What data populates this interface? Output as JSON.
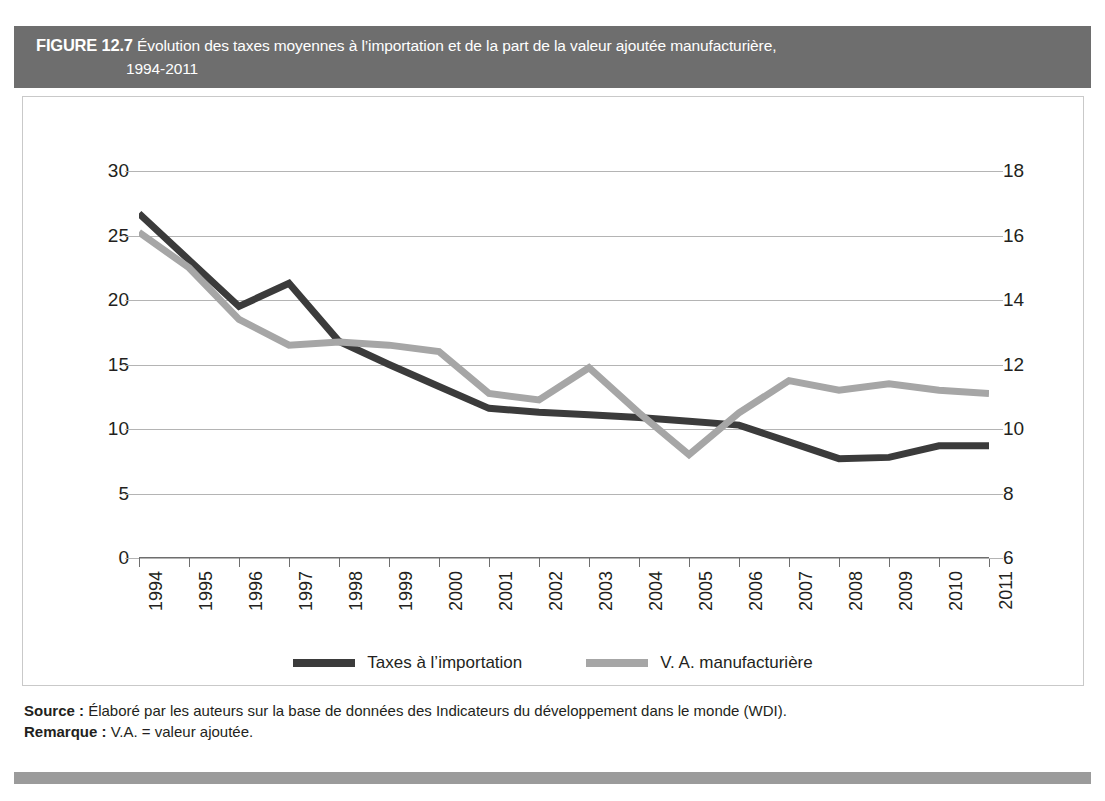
{
  "header": {
    "figure_label": "FIGURE 12.7",
    "title_line1": "Évolution des taxes moyennes à l’importation et de la part de la valeur ajoutée manufacturière,",
    "title_line2": "1994-2011",
    "bar_color": "#6e6e6e",
    "text_color": "#ffffff"
  },
  "legend": {
    "items": [
      {
        "label": "Taxes à l’importation",
        "color": "#3b3b3b"
      },
      {
        "label": "V. A. manufacturière",
        "color": "#a6a6a6"
      }
    ]
  },
  "notes": {
    "source_label": "Source :",
    "source_text": "Élaboré par les auteurs sur la base de données des Indicateurs du développement dans le monde (WDI).",
    "remark_label": "Remarque :",
    "remark_text": "V.A. = valeur ajoutée."
  },
  "chart_data": {
    "type": "line",
    "title": "Évolution des taxes moyennes à l’importation et de la part de la valeur ajoutée manufacturière, 1994-2011",
    "xlabel": "",
    "ylabel": "",
    "grid": true,
    "legend_position": "bottom-center",
    "categories": [
      "1994",
      "1995",
      "1996",
      "1997",
      "1998",
      "1999",
      "2000",
      "2001",
      "2002",
      "2003",
      "2004",
      "2005",
      "2006",
      "2007",
      "2008",
      "2009",
      "2010",
      "2011"
    ],
    "axes": {
      "left": {
        "name": "Taxes à l’importation",
        "ticks": [
          0,
          5,
          10,
          15,
          20,
          25,
          30
        ],
        "ylim": [
          0,
          30
        ]
      },
      "right": {
        "name": "V. A. manufacturière",
        "ticks": [
          6,
          8,
          10,
          12,
          14,
          16,
          18
        ],
        "ylim": [
          6,
          18
        ]
      }
    },
    "series": [
      {
        "name": "Taxes à l’importation",
        "axis": "left",
        "color": "#3b3b3b",
        "values": [
          26.7,
          23.1,
          19.5,
          21.3,
          16.8,
          15.0,
          13.3,
          11.6,
          11.3,
          11.1,
          10.9,
          10.6,
          10.3,
          9.0,
          7.7,
          7.8,
          8.7,
          8.7
        ]
      },
      {
        "name": "V. A. manufacturière",
        "axis": "right",
        "color": "#a6a6a6",
        "values": [
          16.1,
          15.0,
          13.4,
          12.6,
          12.7,
          12.6,
          12.4,
          11.1,
          10.9,
          11.9,
          10.5,
          9.2,
          10.5,
          11.5,
          11.2,
          11.4,
          11.2,
          11.1
        ]
      }
    ]
  }
}
